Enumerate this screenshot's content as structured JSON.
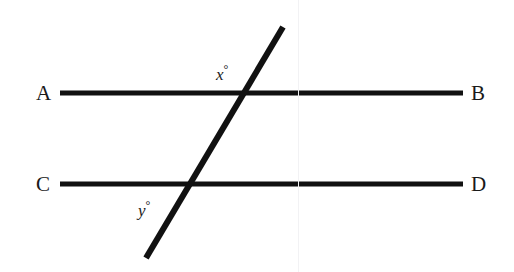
{
  "figure": {
    "kind": "geometry-diagram",
    "width": 514,
    "height": 272,
    "background_color": "#ffffff",
    "stroke_color": "#111111",
    "text_color": "#1a1a1a"
  },
  "labels": {
    "A": "A",
    "B": "B",
    "C": "C",
    "D": "D",
    "x_angle": "x",
    "y_angle": "y",
    "degree_symbol": "°"
  },
  "chart_data": {
    "type": "diagram",
    "title": "",
    "xlabel": "",
    "ylabel": "",
    "coordinate_space": {
      "width": 514,
      "height": 272,
      "origin": "top-left"
    },
    "lines": [
      {
        "name": "line-AB",
        "role": "parallel-line-upper",
        "start_label": "A",
        "end_label": "B",
        "x1": 60,
        "y1": 93,
        "x2": 463,
        "y2": 93,
        "stroke_width": 5,
        "color": "#111111"
      },
      {
        "name": "line-CD",
        "role": "parallel-line-lower",
        "start_label": "C",
        "end_label": "D",
        "x1": 60,
        "y1": 184,
        "x2": 463,
        "y2": 184,
        "stroke_width": 5,
        "color": "#111111"
      },
      {
        "name": "transversal",
        "role": "transversal",
        "start_label": "",
        "end_label": "",
        "x1": 146,
        "y1": 258,
        "x2": 283,
        "y2": 27,
        "stroke_width": 6,
        "color": "#111111"
      }
    ],
    "intersections": [
      {
        "name": "intersection-upper",
        "on_lines": [
          "line-AB",
          "transversal"
        ],
        "x": 243,
        "y": 93
      },
      {
        "name": "intersection-lower",
        "on_lines": [
          "line-CD",
          "transversal"
        ],
        "x": 193,
        "y": 184
      }
    ],
    "angle_marks": [
      {
        "name": "angle-x",
        "label": "x°",
        "variable": "x",
        "at_intersection": "intersection-upper",
        "position": "above-left of transversal, above line AB",
        "x": 222,
        "y": 72
      },
      {
        "name": "angle-y",
        "label": "y°",
        "variable": "y",
        "at_intersection": "intersection-lower",
        "position": "below-left of transversal, below line CD",
        "x": 145,
        "y": 208
      }
    ],
    "point_labels": [
      {
        "name": "A",
        "x": 40,
        "y": 93,
        "anchor": "left-end of line-AB"
      },
      {
        "name": "B",
        "x": 478,
        "y": 93,
        "anchor": "right-end of line-AB"
      },
      {
        "name": "C",
        "x": 40,
        "y": 184,
        "anchor": "left-end of line-CD"
      },
      {
        "name": "D",
        "x": 478,
        "y": 184,
        "anchor": "right-end of line-CD"
      }
    ],
    "grid": false,
    "legend": null
  }
}
